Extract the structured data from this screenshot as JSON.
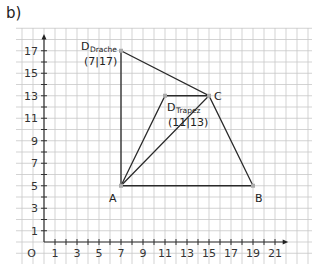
{
  "part_label": "b)",
  "axes": {
    "origin_label": "O",
    "x_ticks": [
      "1",
      "3",
      "5",
      "7",
      "9",
      "11",
      "13",
      "15",
      "17",
      "19",
      "21"
    ],
    "x_tick_values": [
      1,
      3,
      5,
      7,
      9,
      11,
      13,
      15,
      17,
      19,
      21
    ],
    "y_ticks": [
      "1",
      "3",
      "5",
      "7",
      "9",
      "11",
      "13",
      "15",
      "17"
    ],
    "y_tick_values": [
      1,
      3,
      5,
      7,
      9,
      11,
      13,
      15,
      17
    ]
  },
  "points": {
    "A": {
      "label": "A",
      "x": 7,
      "y": 5
    },
    "B": {
      "label": "B",
      "x": 19,
      "y": 5
    },
    "C": {
      "label": "C",
      "x": 15,
      "y": 13
    },
    "D_drache": {
      "label": "D",
      "sub": "Drache",
      "coords": "(7|17)",
      "x": 7,
      "y": 17
    },
    "D_trapez": {
      "label": "D",
      "sub": "Trapez",
      "coords": "(11|13)",
      "x": 11,
      "y": 13
    }
  },
  "shapes": {
    "kite": [
      "A",
      "C",
      "D_drache"
    ],
    "trapezoid": [
      "A",
      "B",
      "C",
      "D_trapez"
    ]
  },
  "chart_data": {
    "type": "scatter",
    "title": "b)",
    "xlabel": "",
    "ylabel": "",
    "xlim": [
      0,
      21
    ],
    "ylim": [
      0,
      17
    ],
    "grid": true,
    "series": [
      {
        "name": "Drache (A, C, D)",
        "points": [
          [
            7,
            5
          ],
          [
            15,
            13
          ],
          [
            7,
            17
          ]
        ]
      },
      {
        "name": "Trapez (A, B, C, D)",
        "points": [
          [
            7,
            5
          ],
          [
            19,
            5
          ],
          [
            15,
            13
          ],
          [
            11,
            13
          ]
        ]
      }
    ],
    "annotations": [
      "A",
      "B",
      "C",
      "D Drache (7|17)",
      "D Trapez (11|13)"
    ]
  }
}
